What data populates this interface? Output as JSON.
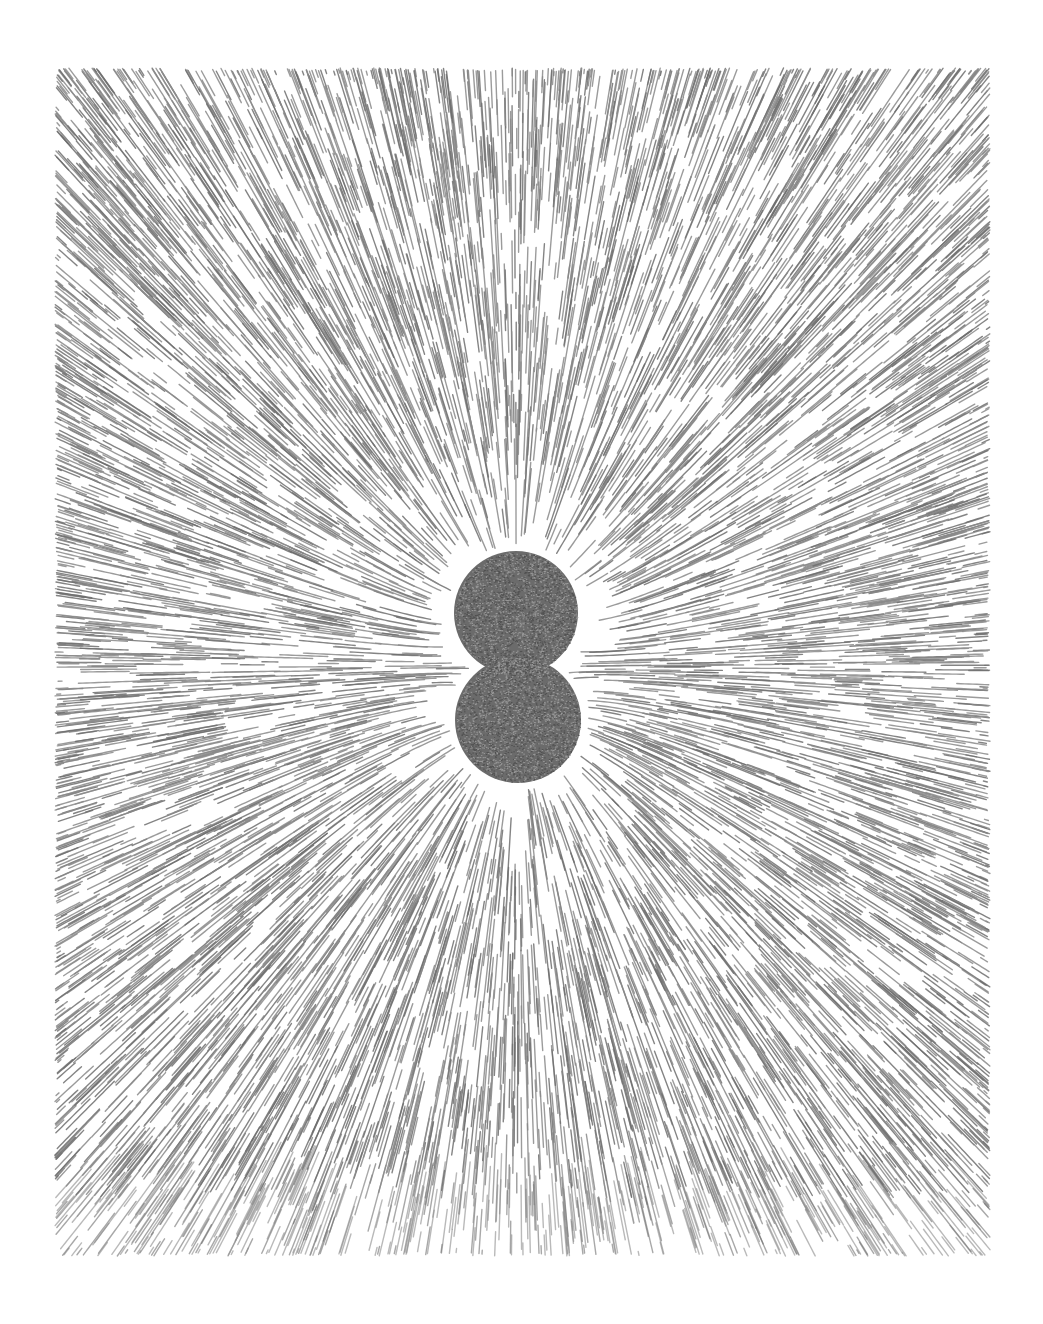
{
  "image": {
    "title": "Field-line pattern around two like charges",
    "description": "Radial line texture (iron-filing / electric-field visualization) surrounding two touching dark discs",
    "width": 1043,
    "height": 1324,
    "background": "#ffffff"
  },
  "field_region": {
    "left": 55,
    "top": 68,
    "right": 990,
    "bottom": 1256,
    "light_band_top": 1198
  },
  "charges": [
    {
      "name": "upper-disc",
      "cx": 516,
      "cy": 613,
      "r": 62,
      "q": 1
    },
    {
      "name": "lower-disc",
      "cx": 518,
      "cy": 720,
      "r": 63,
      "q": 1
    }
  ],
  "colors": {
    "line": "#8a8a8a",
    "line_dark": "#6e6e6e",
    "disc": "#6b6b6b",
    "disc_speckle_light": "#9a9a9a",
    "disc_speckle_dark": "#505050"
  },
  "render": {
    "segments": 9000,
    "seed": 7,
    "segment_min": 14,
    "segment_max": 70,
    "line_width": 1.4
  }
}
